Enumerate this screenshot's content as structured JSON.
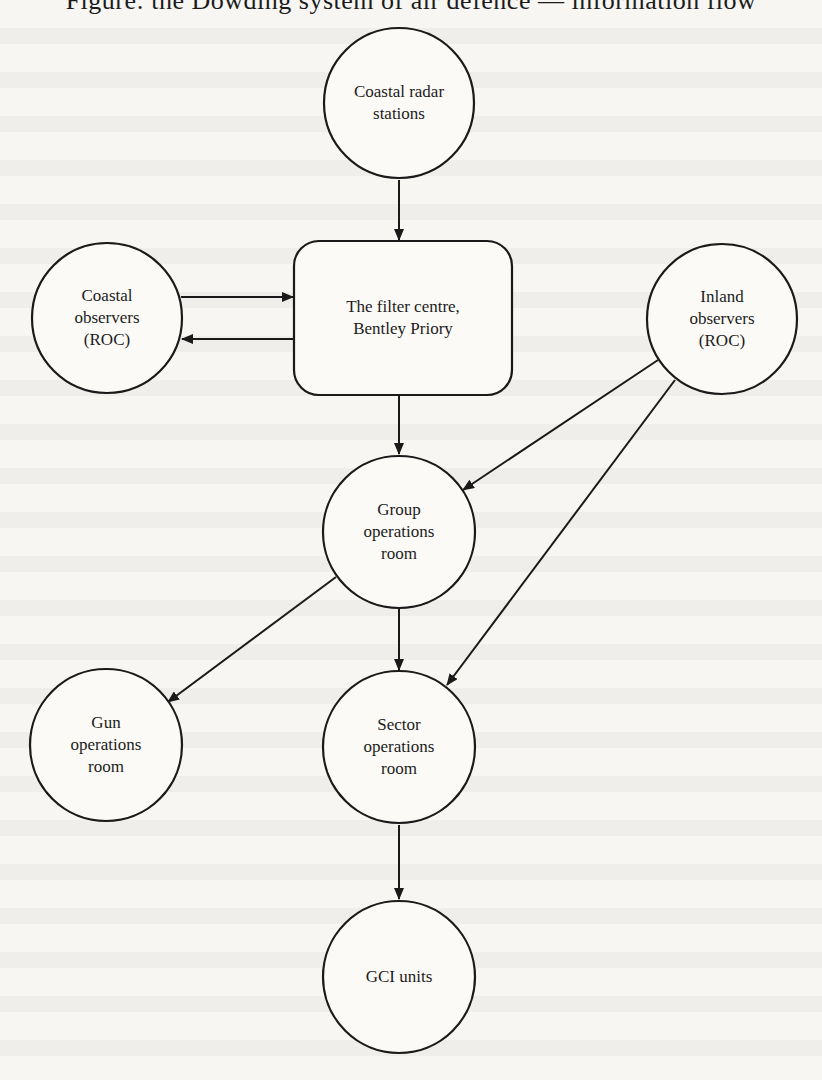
{
  "diagram": {
    "heading_partial": "Figure: the Dowding system of air defence — information flow",
    "nodes": [
      {
        "id": "coastal_radar",
        "shape": "circle",
        "lines": [
          "Coastal radar",
          "stations"
        ]
      },
      {
        "id": "coastal_observers",
        "shape": "circle",
        "lines": [
          "Coastal",
          "observers",
          "(ROC)"
        ]
      },
      {
        "id": "filter_centre",
        "shape": "rounded-rect",
        "lines": [
          "The filter centre,",
          "Bentley Priory"
        ]
      },
      {
        "id": "inland_observers",
        "shape": "circle",
        "lines": [
          "Inland",
          "observers",
          "(ROC)"
        ]
      },
      {
        "id": "group_ops",
        "shape": "circle",
        "lines": [
          "Group",
          "operations",
          "room"
        ]
      },
      {
        "id": "gun_ops",
        "shape": "circle",
        "lines": [
          "Gun",
          "operations",
          "room"
        ]
      },
      {
        "id": "sector_ops",
        "shape": "circle",
        "lines": [
          "Sector",
          "operations",
          "room"
        ]
      },
      {
        "id": "gci_units",
        "shape": "circle",
        "lines": [
          "GCI units"
        ]
      }
    ],
    "edges": [
      {
        "from": "coastal_radar",
        "to": "filter_centre"
      },
      {
        "from": "coastal_observers",
        "to": "filter_centre"
      },
      {
        "from": "filter_centre",
        "to": "coastal_observers"
      },
      {
        "from": "filter_centre",
        "to": "group_ops"
      },
      {
        "from": "inland_observers",
        "to": "group_ops"
      },
      {
        "from": "inland_observers",
        "to": "sector_ops"
      },
      {
        "from": "group_ops",
        "to": "gun_ops"
      },
      {
        "from": "group_ops",
        "to": "sector_ops"
      },
      {
        "from": "sector_ops",
        "to": "gci_units"
      }
    ],
    "colors": {
      "stroke": "#1a1a1a",
      "paper": "#f7f6f3",
      "text": "#1c1c1c"
    }
  }
}
